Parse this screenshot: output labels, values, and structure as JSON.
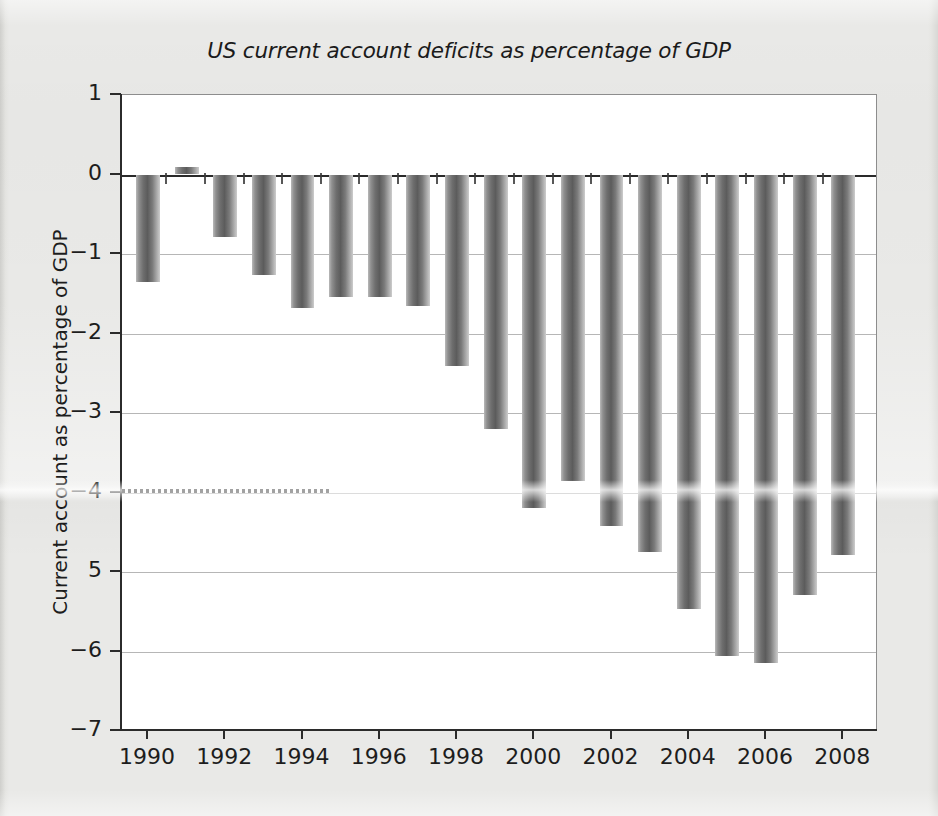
{
  "chart_data": {
    "type": "bar",
    "title": "US current account deficits as percentage of GDP",
    "xlabel": "",
    "ylabel": "Current account as percentage of GDP",
    "categories": [
      1990,
      1991,
      1992,
      1993,
      1994,
      1995,
      1996,
      1997,
      1998,
      1999,
      2000,
      2001,
      2002,
      2003,
      2004,
      2005,
      2006,
      2007,
      2008
    ],
    "values": [
      -1.35,
      0.1,
      -0.78,
      -1.26,
      -1.68,
      -1.54,
      -1.54,
      -1.66,
      -2.41,
      -3.2,
      -4.2,
      -3.85,
      -4.42,
      -4.75,
      -5.47,
      -6.06,
      -6.14,
      -5.29,
      -4.79
    ],
    "ylim": [
      -7,
      1
    ],
    "xlim": [
      1989.3,
      2008.9
    ],
    "ytick_labels": [
      "1",
      "0",
      "−1",
      "−2",
      "−3",
      "−4",
      "5",
      "−6",
      "−7"
    ],
    "ytick_values": [
      1,
      0,
      -1,
      -2,
      -3,
      -4,
      -5,
      -6,
      -7
    ],
    "xtick_labels": [
      "1990",
      "1992",
      "1994",
      "1996",
      "1998",
      "2000",
      "2002",
      "2004",
      "2006",
      "2008"
    ],
    "xtick_values": [
      1990,
      1992,
      1994,
      1996,
      1998,
      2000,
      2002,
      2004,
      2006,
      2008
    ],
    "grid": true,
    "legend": null,
    "bar_color": "#6e6e6e",
    "zero_line_color": "#2a2a2a",
    "grid_color": "#9a9a9a",
    "plot_background": "#ffffff",
    "page_background": "#e9e9e7"
  }
}
